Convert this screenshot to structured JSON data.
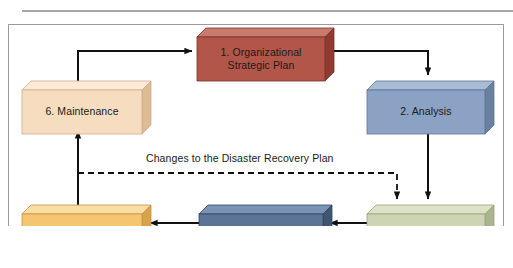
{
  "diagram": {
    "frame": {
      "border_color": "#9b9b9b",
      "rule_color": "#a8a8a8",
      "background": "#ffffff"
    },
    "nodes": [
      {
        "id": "organizational-strategic-plan",
        "label": "1.  Organizational\nStrategic Plan",
        "front_color": "#b2564a",
        "top_color": "#c87a6e",
        "side_color": "#8e3b31",
        "x": 197,
        "y": 28,
        "w": 128,
        "h": 44,
        "depth": 9
      },
      {
        "id": "analysis",
        "label": "2.  Analysis",
        "front_color": "#8ba2c4",
        "top_color": "#a9bcd6",
        "side_color": "#69809f",
        "x": 367,
        "y": 81,
        "w": 118,
        "h": 44,
        "depth": 9
      },
      {
        "id": "design",
        "label": "3.  Design",
        "front_color": "#ccd4b4",
        "top_color": "#dce2c8",
        "side_color": "#aab48d",
        "x": 367,
        "y": 205,
        "w": 118,
        "h": 40,
        "depth": 9
      },
      {
        "id": "implementation",
        "label": "4.  Implementation",
        "front_color": "#5b7498",
        "top_color": "#7b93b4",
        "side_color": "#3f5573",
        "x": 199,
        "y": 205,
        "w": 124,
        "h": 40,
        "depth": 9
      },
      {
        "id": "testing",
        "label": "5.  Testing",
        "front_color": "#f5c571",
        "top_color": "#fadda3",
        "side_color": "#d9a34b",
        "x": 22,
        "y": 205,
        "w": 120,
        "h": 40,
        "depth": 9
      },
      {
        "id": "maintenance",
        "label": "6.  Maintenance",
        "front_color": "#f7ddbf",
        "top_color": "#fbead6",
        "side_color": "#dcbb95",
        "x": 22,
        "y": 81,
        "w": 120,
        "h": 44,
        "depth": 9
      }
    ],
    "edges": [
      {
        "id": "maintenance-to-plan",
        "from": "maintenance",
        "to": "organizational-strategic-plan",
        "style": "solid"
      },
      {
        "id": "plan-to-analysis",
        "from": "organizational-strategic-plan",
        "to": "analysis",
        "style": "solid"
      },
      {
        "id": "analysis-to-design",
        "from": "analysis",
        "to": "design",
        "style": "solid"
      },
      {
        "id": "design-to-implementation",
        "from": "design",
        "to": "implementation",
        "style": "solid"
      },
      {
        "id": "implementation-to-testing",
        "from": "implementation",
        "to": "testing",
        "style": "solid"
      },
      {
        "id": "testing-to-maintenance",
        "from": "testing",
        "to": "maintenance",
        "style": "solid"
      },
      {
        "id": "changes-feedback",
        "from": "testing-to-maintenance",
        "to": "design",
        "style": "dashed",
        "label": "Changes to the Disaster Recovery Plan"
      }
    ],
    "edge_label": "Changes to the Disaster Recovery Plan",
    "line_color": "#111111"
  }
}
